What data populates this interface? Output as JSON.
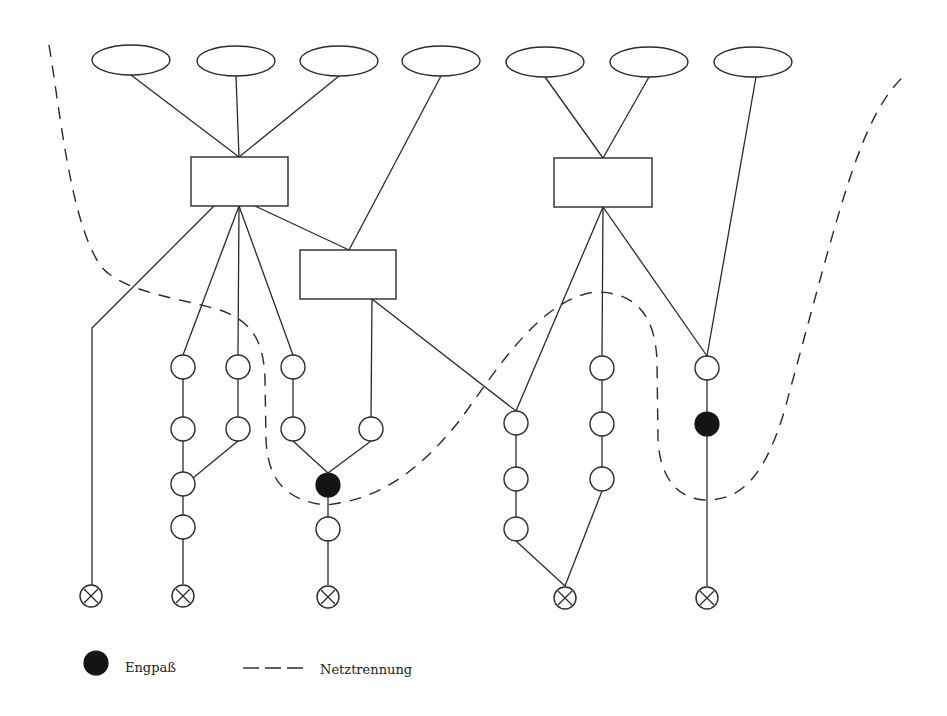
{
  "legend": {
    "bottleneck_label": "Engpaß",
    "separation_label": "Netztrennung",
    "bottleneck_icon": "filled-circle",
    "separation_icon": "dashed-line"
  },
  "colors": {
    "line": "#2a2a2a",
    "bottleneck_fill": "#141414",
    "background": "#ffffff"
  },
  "nodes": {
    "sources": [
      {
        "id": "e1",
        "cx": 131,
        "cy": 60
      },
      {
        "id": "e2",
        "cx": 236,
        "cy": 61
      },
      {
        "id": "e3",
        "cx": 339,
        "cy": 61
      },
      {
        "id": "e4",
        "cx": 441,
        "cy": 61
      },
      {
        "id": "e5",
        "cx": 545,
        "cy": 62
      },
      {
        "id": "e6",
        "cx": 649,
        "cy": 62
      },
      {
        "id": "e7",
        "cx": 753,
        "cy": 62
      }
    ],
    "hubs": [
      {
        "id": "b1",
        "x": 191,
        "y": 157,
        "w": 97,
        "h": 49
      },
      {
        "id": "b2",
        "x": 554,
        "y": 158,
        "w": 98,
        "h": 49
      },
      {
        "id": "b3",
        "x": 300,
        "y": 250,
        "w": 96,
        "h": 49
      }
    ],
    "circles": [
      {
        "id": "a1",
        "cx": 183,
        "cy": 367
      },
      {
        "id": "a2",
        "cx": 183,
        "cy": 429
      },
      {
        "id": "a3",
        "cx": 183,
        "cy": 484
      },
      {
        "id": "a4",
        "cx": 183,
        "cy": 527
      },
      {
        "id": "b1c",
        "cx": 238,
        "cy": 367
      },
      {
        "id": "b2c",
        "cx": 238,
        "cy": 429
      },
      {
        "id": "c1",
        "cx": 293,
        "cy": 367
      },
      {
        "id": "c2",
        "cx": 293,
        "cy": 429
      },
      {
        "id": "d1",
        "cx": 371,
        "cy": 429
      },
      {
        "id": "m1",
        "cx": 328,
        "cy": 529
      },
      {
        "id": "f1",
        "cx": 516,
        "cy": 423
      },
      {
        "id": "f2",
        "cx": 516,
        "cy": 479
      },
      {
        "id": "f3",
        "cx": 516,
        "cy": 529
      },
      {
        "id": "g1",
        "cx": 602,
        "cy": 368
      },
      {
        "id": "g2",
        "cx": 602,
        "cy": 424
      },
      {
        "id": "g3",
        "cx": 602,
        "cy": 479
      },
      {
        "id": "h1",
        "cx": 707,
        "cy": 368
      }
    ],
    "bottlenecks": [
      {
        "id": "k1",
        "cx": 328,
        "cy": 485
      },
      {
        "id": "k2",
        "cx": 707,
        "cy": 424
      }
    ],
    "sinks": [
      {
        "id": "x1",
        "cx": 91,
        "cy": 596
      },
      {
        "id": "x2",
        "cx": 183,
        "cy": 596
      },
      {
        "id": "x3",
        "cx": 328,
        "cy": 597
      },
      {
        "id": "x4",
        "cx": 565,
        "cy": 598
      },
      {
        "id": "x5",
        "cx": 707,
        "cy": 598
      }
    ]
  }
}
